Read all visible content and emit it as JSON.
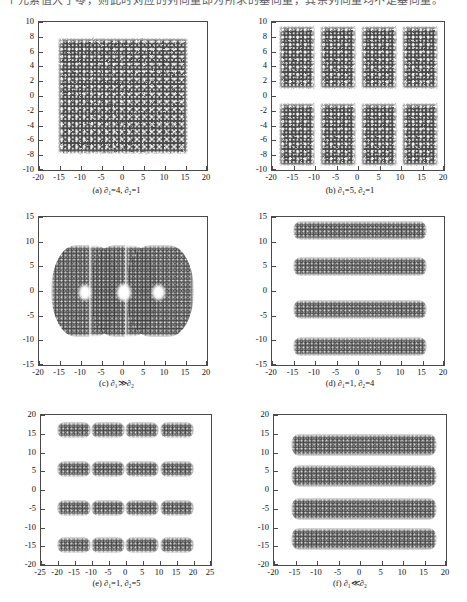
{
  "top_text": {
    "line": "个元素值大于零，则此时对应的列向量即为所求的基向量，其余列向量均不是基向量。"
  },
  "figure": {
    "panel_count": 6
  },
  "chart_data": [
    {
      "id": "a",
      "type": "scatter",
      "title": "",
      "caption_prefix": "(a)",
      "caption": "(a) ∂₁=4, ∂₂=1",
      "params": {
        "d1": "4",
        "d2": "1"
      },
      "xlabel": "",
      "ylabel": "",
      "xlim": [
        -20,
        20
      ],
      "ylim": [
        -10,
        10
      ],
      "xticks": [
        -20,
        -15,
        -10,
        -5,
        0,
        5,
        10,
        15,
        20
      ],
      "yticks": [
        10,
        8,
        6,
        4,
        2,
        0,
        -2,
        -4,
        -6,
        -8,
        -10
      ],
      "xtick_labels": [
        "-20",
        "-15",
        "-10",
        "-5",
        "0",
        "5",
        "10",
        "15",
        "20"
      ],
      "ytick_labels": [
        "10",
        "8",
        "6",
        "4",
        "2",
        "0",
        "-2",
        "-4",
        "-6",
        "-8",
        "-10"
      ],
      "grid": false,
      "legend": "none",
      "point_color": "#3a3a3a",
      "description": "Single dense lattice-patterned rectangular cloud filling the plot interior",
      "clusters": [
        {
          "cx": 0,
          "cy": 0,
          "half_w": 15.5,
          "half_h": 7.8,
          "style": "lattice"
        }
      ]
    },
    {
      "id": "b",
      "type": "scatter",
      "title": "",
      "caption_prefix": "(b)",
      "caption": "(b) ∂₁=5, ∂₂=1",
      "params": {
        "d1": "5",
        "d2": "1"
      },
      "xlabel": "",
      "ylabel": "",
      "xlim": [
        -20,
        20
      ],
      "ylim": [
        -10,
        10
      ],
      "xticks": [
        -20,
        -15,
        -10,
        -5,
        0,
        5,
        10,
        15,
        20
      ],
      "yticks": [
        10,
        8,
        6,
        4,
        2,
        0,
        -2,
        -4,
        -6,
        -8,
        -10
      ],
      "xtick_labels": [
        "-20",
        "-15",
        "-10",
        "-5",
        "0",
        "5",
        "10",
        "15",
        "20"
      ],
      "ytick_labels": [
        "10",
        "8",
        "6",
        "4",
        "2",
        "0",
        "-2",
        "-4",
        "-6",
        "-8",
        "-10"
      ],
      "grid": false,
      "legend": "none",
      "point_color": "#3a3a3a",
      "description": "Eight rectangular lattice blocks arranged as 4 columns by 2 rows",
      "clusters": [
        {
          "cx": -14.2,
          "cy": 5.2,
          "half_w": 4.2,
          "half_h": 4.2,
          "style": "lattice"
        },
        {
          "cx": -4.6,
          "cy": 5.2,
          "half_w": 4.2,
          "half_h": 4.2,
          "style": "lattice"
        },
        {
          "cx": 4.8,
          "cy": 5.2,
          "half_w": 4.2,
          "half_h": 4.2,
          "style": "lattice"
        },
        {
          "cx": 14.4,
          "cy": 5.2,
          "half_w": 4.2,
          "half_h": 4.2,
          "style": "lattice"
        },
        {
          "cx": -14.2,
          "cy": -5.2,
          "half_w": 4.2,
          "half_h": 4.2,
          "style": "lattice"
        },
        {
          "cx": -4.6,
          "cy": -5.2,
          "half_w": 4.2,
          "half_h": 4.2,
          "style": "lattice"
        },
        {
          "cx": 4.8,
          "cy": -5.2,
          "half_w": 4.2,
          "half_h": 4.2,
          "style": "lattice"
        },
        {
          "cx": 14.4,
          "cy": -5.2,
          "half_w": 4.2,
          "half_h": 4.2,
          "style": "lattice"
        }
      ]
    },
    {
      "id": "c",
      "type": "scatter",
      "title": "",
      "caption_prefix": "(c)",
      "caption": "(c) ∂₁≫∂₂",
      "params": {
        "relation": "≫"
      },
      "xlabel": "",
      "ylabel": "",
      "xlim": [
        -20,
        20
      ],
      "ylim": [
        -15,
        15
      ],
      "xticks": [
        -20,
        -15,
        -10,
        -5,
        0,
        5,
        10,
        15,
        20
      ],
      "yticks": [
        15,
        10,
        5,
        0,
        -5,
        -10,
        -15
      ],
      "xtick_labels": [
        "-20",
        "-15",
        "-10",
        "-5",
        "0",
        "5",
        "10",
        "15",
        "20"
      ],
      "ytick_labels": [
        "15",
        "10",
        "5",
        "0",
        "-5",
        "-10",
        "-15"
      ],
      "grid": false,
      "legend": "none",
      "point_color": "#3d3d3d",
      "description": "One large merged wavy cloud spanning x -17..17, y -10..10 with three small white holes near y=0",
      "clusters": [
        {
          "cx": -9.0,
          "cy": 0,
          "half_w": 8.2,
          "half_h": 9.3,
          "style": "soft"
        },
        {
          "cx": 0.0,
          "cy": 0,
          "half_w": 8.2,
          "half_h": 9.3,
          "style": "soft"
        },
        {
          "cx": 8.6,
          "cy": 0,
          "half_w": 8.2,
          "half_h": 9.3,
          "style": "soft"
        }
      ],
      "holes": [
        {
          "cx": -9.0,
          "cy": -0.3,
          "r": 1.5
        },
        {
          "cx": 0.2,
          "cy": -0.3,
          "r": 1.7
        },
        {
          "cx": 8.4,
          "cy": -0.3,
          "r": 1.5
        }
      ]
    },
    {
      "id": "d",
      "type": "scatter",
      "title": "",
      "caption_prefix": "(d)",
      "caption": "(d) ∂₁=1, ∂₂=4",
      "params": {
        "d1": "1",
        "d2": "4"
      },
      "xlabel": "",
      "ylabel": "",
      "xlim": [
        -20,
        20
      ],
      "ylim": [
        -15,
        15
      ],
      "xticks": [
        -20,
        -15,
        -10,
        -5,
        0,
        5,
        10,
        15,
        20
      ],
      "yticks": [
        15,
        10,
        5,
        0,
        -5,
        -10,
        -15
      ],
      "xtick_labels": [
        "-20",
        "-15",
        "-10",
        "-5",
        "0",
        "5",
        "10",
        "15",
        "20"
      ],
      "ytick_labels": [
        "15",
        "10",
        "5",
        "0",
        "-5",
        "-10",
        "-15"
      ],
      "grid": false,
      "legend": "none",
      "point_color": "#3d3d3d",
      "description": "Four thin horizontal bands spanning x -15..16",
      "clusters": [
        {
          "cx": 0.5,
          "cy": 12.2,
          "half_w": 15.6,
          "half_h": 1.9,
          "style": "band"
        },
        {
          "cx": 0.5,
          "cy": 4.9,
          "half_w": 15.6,
          "half_h": 1.9,
          "style": "band"
        },
        {
          "cx": 0.5,
          "cy": -3.8,
          "half_w": 15.6,
          "half_h": 1.9,
          "style": "band"
        },
        {
          "cx": 0.5,
          "cy": -11.2,
          "half_w": 15.6,
          "half_h": 1.9,
          "style": "band"
        }
      ]
    },
    {
      "id": "e",
      "type": "scatter",
      "title": "",
      "caption_prefix": "(e)",
      "caption": "(e) ∂₁=1, ∂₂=5",
      "params": {
        "d1": "1",
        "d2": "5"
      },
      "xlabel": "",
      "ylabel": "",
      "xlim": [
        -25,
        25
      ],
      "ylim": [
        -20,
        20
      ],
      "xticks": [
        -25,
        -20,
        -15,
        -10,
        -5,
        0,
        5,
        10,
        15,
        20,
        25
      ],
      "yticks": [
        20,
        15,
        10,
        5,
        0,
        -5,
        -10,
        -15,
        -20
      ],
      "xtick_labels": [
        "-25",
        "-20",
        "-15",
        "-10",
        "-5",
        "0",
        "5",
        "10",
        "15",
        "20",
        "25"
      ],
      "ytick_labels": [
        "20",
        "15",
        "10",
        "5",
        "0",
        "-5",
        "-10",
        "-15",
        "-20"
      ],
      "grid": false,
      "legend": "none",
      "point_color": "#3d3d3d",
      "description": "Sixteen rectangular blocks in a 4 by 4 grid",
      "clusters": [
        {
          "cx": -15.2,
          "cy": 16.0,
          "half_w": 5.0,
          "half_h": 2.2,
          "style": "band"
        },
        {
          "cx": -5.3,
          "cy": 16.0,
          "half_w": 5.0,
          "half_h": 2.2,
          "style": "band"
        },
        {
          "cx": 4.8,
          "cy": 16.0,
          "half_w": 5.0,
          "half_h": 2.2,
          "style": "band"
        },
        {
          "cx": 15.0,
          "cy": 16.0,
          "half_w": 5.0,
          "half_h": 2.2,
          "style": "band"
        },
        {
          "cx": -15.2,
          "cy": 5.6,
          "half_w": 5.0,
          "half_h": 2.2,
          "style": "band"
        },
        {
          "cx": -5.3,
          "cy": 5.6,
          "half_w": 5.0,
          "half_h": 2.2,
          "style": "band"
        },
        {
          "cx": 4.8,
          "cy": 5.6,
          "half_w": 5.0,
          "half_h": 2.2,
          "style": "band"
        },
        {
          "cx": 15.0,
          "cy": 5.6,
          "half_w": 5.0,
          "half_h": 2.2,
          "style": "band"
        },
        {
          "cx": -15.2,
          "cy": -4.8,
          "half_w": 5.0,
          "half_h": 2.2,
          "style": "band"
        },
        {
          "cx": -5.3,
          "cy": -4.8,
          "half_w": 5.0,
          "half_h": 2.2,
          "style": "band"
        },
        {
          "cx": 4.8,
          "cy": -4.8,
          "half_w": 5.0,
          "half_h": 2.2,
          "style": "band"
        },
        {
          "cx": 15.0,
          "cy": -4.8,
          "half_w": 5.0,
          "half_h": 2.2,
          "style": "band"
        },
        {
          "cx": -15.2,
          "cy": -14.6,
          "half_w": 5.0,
          "half_h": 2.2,
          "style": "band"
        },
        {
          "cx": -5.3,
          "cy": -14.6,
          "half_w": 5.0,
          "half_h": 2.2,
          "style": "band"
        },
        {
          "cx": 4.8,
          "cy": -14.6,
          "half_w": 5.0,
          "half_h": 2.2,
          "style": "band"
        },
        {
          "cx": 15.0,
          "cy": -14.6,
          "half_w": 5.0,
          "half_h": 2.2,
          "style": "band"
        }
      ]
    },
    {
      "id": "f",
      "type": "scatter",
      "title": "",
      "caption_prefix": "(f)",
      "caption": "(f) ∂₁≪∂₂",
      "params": {
        "relation": "≪"
      },
      "xlabel": "",
      "ylabel": "",
      "xlim": [
        -20,
        20
      ],
      "ylim": [
        -20,
        20
      ],
      "xticks": [
        -20,
        -15,
        -10,
        -5,
        0,
        5,
        10,
        15,
        20
      ],
      "yticks": [
        20,
        15,
        10,
        5,
        0,
        -5,
        -10,
        -15,
        -20
      ],
      "xtick_labels": [
        "-20",
        "-15",
        "-10",
        "-5",
        "0",
        "5",
        "10",
        "15",
        "20"
      ],
      "ytick_labels": [
        "20",
        "15",
        "10",
        "5",
        "0",
        "-5",
        "-10",
        "-15",
        "-20"
      ],
      "grid": false,
      "legend": "none",
      "point_color": "#3d3d3d",
      "description": "Four thick diffuse horizontal bands spanning x -16..18",
      "clusters": [
        {
          "cx": 1.0,
          "cy": 12.0,
          "half_w": 17.0,
          "half_h": 2.9,
          "style": "band blurry"
        },
        {
          "cx": 1.0,
          "cy": 3.8,
          "half_w": 17.0,
          "half_h": 2.9,
          "style": "band blurry"
        },
        {
          "cx": 1.0,
          "cy": -5.0,
          "half_w": 17.0,
          "half_h": 2.9,
          "style": "band blurry"
        },
        {
          "cx": 1.0,
          "cy": -13.0,
          "half_w": 17.0,
          "half_h": 2.9,
          "style": "band blurry"
        }
      ]
    }
  ]
}
